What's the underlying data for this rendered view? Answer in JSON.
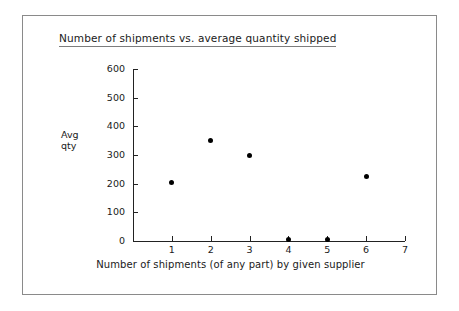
{
  "chart_data": {
    "type": "scatter",
    "title": "Number of shipments vs. average quantity shipped",
    "xlabel": "Number of shipments (of any part) by given supplier",
    "ylabel": "Avg qty",
    "ylabel_lines": [
      "Avg",
      "qty"
    ],
    "x": [
      1,
      2,
      3,
      4,
      5,
      6
    ],
    "values": [
      205,
      350,
      300,
      5,
      5,
      225
    ],
    "xlim": [
      0,
      7
    ],
    "ylim": [
      0,
      600
    ],
    "xticks": [
      1,
      2,
      3,
      4,
      5,
      6,
      7
    ],
    "xtick_labels": [
      "1",
      "2",
      "3",
      "4",
      "5",
      "6",
      "7"
    ],
    "yticks": [
      0,
      100,
      200,
      300,
      400,
      500,
      600
    ],
    "ytick_labels": [
      "0",
      "100",
      "200",
      "300",
      "400",
      "500",
      "600"
    ],
    "grid": false,
    "legend": null,
    "marker_color": "#000000",
    "axis_color": "#222222",
    "frame_color": "#8a8a8a",
    "background": "#ffffff"
  }
}
